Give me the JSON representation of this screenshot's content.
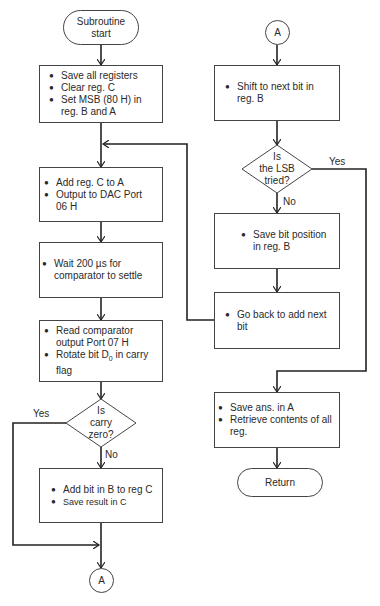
{
  "page": {
    "header_fragment": ""
  },
  "flowchart": {
    "left_column": {
      "start": {
        "label_line1": "Subroutine",
        "label_line2": "start"
      },
      "init_box": {
        "items": [
          "Save all registers",
          "Clear reg. C",
          "Set MSB (80 H) in reg. B and A"
        ]
      },
      "add_box": {
        "items": [
          "Add reg. C to A",
          "Output to DAC Port 06 H"
        ]
      },
      "wait_box": {
        "items": [
          "Wait 200 µs for comparator to settle"
        ]
      },
      "read_box": {
        "items": [
          "Read comparator output Port 07 H",
          "Rotate bit D",
          "0",
          " in carry flag"
        ]
      },
      "carry_decision": {
        "line1": "Is",
        "line2": "carry",
        "line3": "zero?",
        "yes_label": "Yes",
        "no_label": "No"
      },
      "addbit_box": {
        "items": [
          "Add bit in B to reg C",
          "Save result in C"
        ]
      },
      "connector_out": {
        "label": "A"
      }
    },
    "right_column": {
      "connector_in": {
        "label": "A"
      },
      "shift_box": {
        "items": [
          "Shift to next bit in reg. B"
        ]
      },
      "lsb_decision": {
        "line1": "Is",
        "line2": "the LSB",
        "line3": "tried?",
        "yes_label": "Yes",
        "no_label": "No"
      },
      "savepos_box": {
        "items": [
          "Save bit position in reg. B"
        ]
      },
      "goback_box": {
        "items": [
          "Go back to add next bit"
        ]
      },
      "saveans_box": {
        "items": [
          "Save ans. in A",
          "Retrieve contents of all reg."
        ]
      },
      "end": {
        "label": "Return"
      }
    },
    "colors": {
      "line": "#222222",
      "box_border": "#444444",
      "text": "#2a2a2a",
      "background": "#ffffff"
    }
  }
}
